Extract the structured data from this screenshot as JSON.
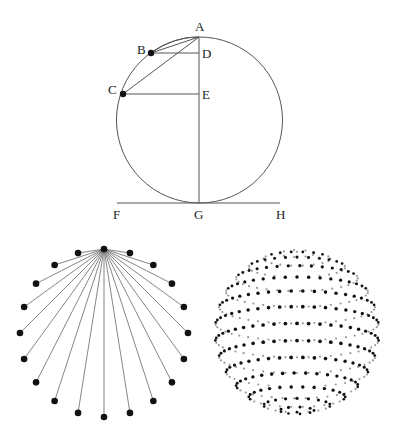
{
  "figure_top": {
    "title": "Circle construction with chords and tangent",
    "circle": {
      "cx": 199.5,
      "cy": 120,
      "r": 83
    },
    "points": [
      {
        "name": "A",
        "x": 199,
        "y": 37,
        "dot": false,
        "label_dx": -4,
        "label_dy": -6
      },
      {
        "name": "B",
        "x": 151,
        "y": 53,
        "dot": true,
        "label_dx": -14,
        "label_dy": 1
      },
      {
        "name": "C",
        "x": 123,
        "y": 94,
        "dot": true,
        "label_dx": -15,
        "label_dy": 0
      },
      {
        "name": "D",
        "x": 199,
        "y": 53,
        "dot": false,
        "label_dx": 3,
        "label_dy": 5
      },
      {
        "name": "E",
        "x": 199,
        "y": 94,
        "dot": false,
        "label_dx": 3,
        "label_dy": 5
      },
      {
        "name": "F",
        "x": 117,
        "y": 203,
        "dot": false,
        "label_dx": -4,
        "label_dy": 16
      },
      {
        "name": "G",
        "x": 199,
        "y": 203,
        "dot": false,
        "label_dx": -5,
        "label_dy": 16
      },
      {
        "name": "H",
        "x": 280,
        "y": 203,
        "dot": false,
        "label_dx": -4,
        "label_dy": 16
      }
    ],
    "segments": [
      [
        "A",
        "B"
      ],
      [
        "A",
        "C"
      ],
      [
        "B",
        "D"
      ],
      [
        "C",
        "E"
      ],
      [
        "A",
        "G"
      ],
      [
        "F",
        "H"
      ]
    ],
    "arc_chord_AB": true
  },
  "figure_fan": {
    "title": "Chords from top point to points on circle",
    "cx": 104,
    "cy": 333,
    "r": 84,
    "num_points": 20
  },
  "figure_sphere": {
    "title": "Sphere of dots on latitude rings",
    "cx": 297,
    "cy": 332,
    "r": 82,
    "tilt_deg": 12,
    "num_rings": 15,
    "dots_per_ring_at_equator": 44
  },
  "labels": {
    "A": "A",
    "B": "B",
    "C": "C",
    "D": "D",
    "E": "E",
    "F": "F",
    "G": "G",
    "H": "H"
  },
  "colors": {
    "line": "#555555",
    "dot": "#111111",
    "dot_back": "#9a9a9a",
    "background": "#ffffff"
  }
}
